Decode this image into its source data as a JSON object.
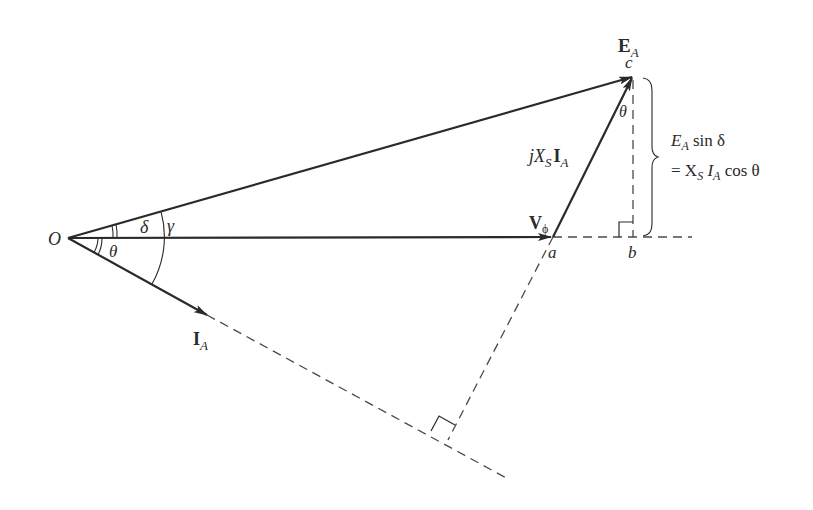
{
  "diagram": {
    "points": {
      "origin": {
        "label": "O",
        "x": 68,
        "y": 238
      },
      "a": {
        "label": "a",
        "x": 553,
        "y": 237
      },
      "b": {
        "label": "b",
        "x": 633,
        "y": 237
      },
      "c": {
        "label": "c",
        "x": 633,
        "y": 76
      }
    },
    "phasors": {
      "EA": {
        "main": "E",
        "sub": "A"
      },
      "Vphi": {
        "main": "V",
        "sub": "ϕ"
      },
      "IA": {
        "main": "I",
        "sub": "A"
      },
      "jXsIA": {
        "prefix": "jX",
        "sub1": "S",
        "main": "I",
        "sub2": "A"
      }
    },
    "angles": {
      "delta": "δ",
      "gamma": "γ",
      "theta_origin": "θ",
      "theta_c": "θ"
    },
    "equation": {
      "line1_E": "E",
      "line1_sub": "A",
      "line1_rest": " sin δ",
      "line2_eq": "= X",
      "line2_sub1": "S",
      "line2_I": " I",
      "line2_sub2": "A",
      "line2_rest": " cos θ"
    },
    "colors": {
      "stroke": "#2a2a2a",
      "dash": "#4a4a4a",
      "background": "#ffffff"
    }
  }
}
